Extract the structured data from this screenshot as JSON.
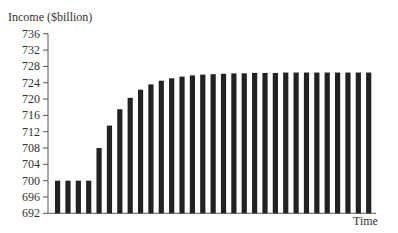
{
  "chart_data": {
    "type": "bar",
    "title": "",
    "ylabel": "Income ($billion)",
    "xlabel": "Time",
    "ylim": [
      692,
      736
    ],
    "yticks": [
      692,
      696,
      700,
      704,
      708,
      712,
      716,
      720,
      724,
      728,
      732,
      736
    ],
    "grid": false,
    "legend": null,
    "categories": [
      "1",
      "2",
      "3",
      "4",
      "5",
      "6",
      "7",
      "8",
      "9",
      "10",
      "11",
      "12",
      "13",
      "14",
      "15",
      "16",
      "17",
      "18",
      "19",
      "20",
      "21",
      "22",
      "23",
      "24",
      "25",
      "26",
      "27",
      "28",
      "29",
      "30",
      "31"
    ],
    "values": [
      700,
      700,
      700,
      700,
      708,
      713.5,
      717.5,
      720.3,
      722.3,
      723.6,
      724.5,
      725.1,
      725.5,
      725.8,
      726.0,
      726.1,
      726.2,
      726.3,
      726.3,
      726.4,
      726.4,
      726.4,
      726.5,
      726.5,
      726.5,
      726.5,
      726.5,
      726.5,
      726.5,
      726.5,
      726.5
    ],
    "bar_color": "#222222"
  }
}
